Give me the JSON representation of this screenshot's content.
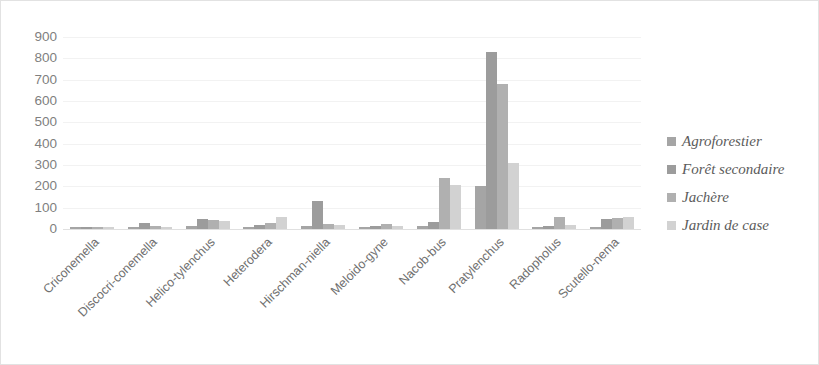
{
  "chart_data": {
    "type": "bar",
    "title": "",
    "xlabel": "",
    "ylabel": "",
    "ylim": [
      0,
      900
    ],
    "y_ticks": [
      900,
      800,
      700,
      600,
      500,
      400,
      300,
      200,
      100,
      0
    ],
    "grid": true,
    "legend_position": "right",
    "categories": [
      "Criconemella",
      "Discocri-conemella",
      "Helico-tylenchus",
      "Heterodera",
      "Hirschman-niella",
      "Meloido-gyne",
      "Nacob-bus",
      "Pratylenchus",
      "Radopholus",
      "Scutello-nema"
    ],
    "series": [
      {
        "name": "Agroforestier",
        "color": "#a5a5a5",
        "values": [
          8,
          10,
          12,
          10,
          12,
          10,
          12,
          200,
          8,
          10
        ]
      },
      {
        "name": "Forêt secondaire",
        "color": "#9c9c9c",
        "values": [
          10,
          30,
          45,
          20,
          130,
          15,
          35,
          830,
          15,
          45
        ]
      },
      {
        "name": "Jachère",
        "color": "#b0b0b0",
        "values": [
          8,
          12,
          42,
          30,
          25,
          25,
          240,
          680,
          55,
          50
        ]
      },
      {
        "name": "Jardin de case",
        "color": "#d2d2d2",
        "values": [
          8,
          10,
          38,
          55,
          20,
          12,
          205,
          310,
          20,
          55
        ]
      }
    ]
  },
  "legend": {
    "items": [
      {
        "label": "Agroforestier"
      },
      {
        "label": "Forêt secondaire"
      },
      {
        "label": "Jachère"
      },
      {
        "label": "Jardin de case"
      }
    ]
  }
}
